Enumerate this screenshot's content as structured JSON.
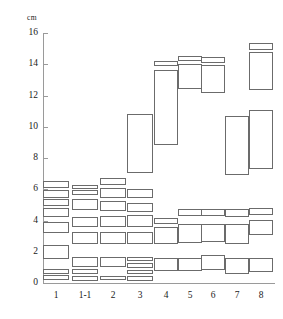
{
  "chart_data": {
    "type": "bar",
    "title": "",
    "subtitle": "",
    "xlabel": "",
    "ylabel": "cm",
    "unit_label": "cm",
    "ylim": [
      0,
      16
    ],
    "yticks": [
      0,
      2,
      4,
      6,
      8,
      10,
      12,
      14,
      16
    ],
    "ytick_labels": [
      "0",
      "2",
      "4",
      "6",
      "8",
      "10",
      "12",
      "14",
      "16"
    ],
    "grid": false,
    "legend": null,
    "categories": [
      "1",
      "1-1",
      "2",
      "3",
      "4",
      "5",
      "6",
      "7",
      "8"
    ],
    "lanes": [
      {
        "label": "1",
        "bands": [
          {
            "low": 6.05,
            "high": 6.55
          },
          {
            "low": 5.45,
            "high": 5.95
          },
          {
            "low": 4.9,
            "high": 5.35
          },
          {
            "low": 4.25,
            "high": 4.8
          },
          {
            "low": 3.2,
            "high": 3.9
          },
          {
            "low": 1.5,
            "high": 2.45
          },
          {
            "low": 0.55,
            "high": 0.9
          },
          {
            "low": 0.2,
            "high": 0.5
          }
        ]
      },
      {
        "label": "1-1",
        "bands": [
          {
            "low": 6.0,
            "high": 6.25
          },
          {
            "low": 5.65,
            "high": 5.95
          },
          {
            "low": 4.65,
            "high": 5.35
          },
          {
            "low": 3.55,
            "high": 4.25
          },
          {
            "low": 2.5,
            "high": 3.25
          },
          {
            "low": 1.05,
            "high": 1.65
          },
          {
            "low": 0.55,
            "high": 0.9
          },
          {
            "low": 0.15,
            "high": 0.45
          }
        ]
      },
      {
        "label": "2",
        "bands": [
          {
            "low": 6.25,
            "high": 6.7
          },
          {
            "low": 5.45,
            "high": 6.1
          },
          {
            "low": 4.6,
            "high": 5.25
          },
          {
            "low": 3.55,
            "high": 4.3
          },
          {
            "low": 2.5,
            "high": 3.25
          },
          {
            "low": 1.0,
            "high": 1.65
          },
          {
            "low": 0.2,
            "high": 0.45
          }
        ]
      },
      {
        "label": "3",
        "bands": [
          {
            "low": 7.05,
            "high": 10.85
          },
          {
            "low": 5.45,
            "high": 6.05
          },
          {
            "low": 4.55,
            "high": 5.15
          },
          {
            "low": 3.6,
            "high": 4.35
          },
          {
            "low": 2.5,
            "high": 3.25
          },
          {
            "low": 1.4,
            "high": 1.65
          },
          {
            "low": 0.95,
            "high": 1.3
          },
          {
            "low": 0.55,
            "high": 0.85
          },
          {
            "low": 0.15,
            "high": 0.45
          }
        ]
      },
      {
        "label": "4",
        "bands": [
          {
            "low": 13.9,
            "high": 14.2
          },
          {
            "low": 8.85,
            "high": 13.65
          },
          {
            "low": 3.75,
            "high": 4.15
          },
          {
            "low": 2.5,
            "high": 3.6
          },
          {
            "low": 0.75,
            "high": 1.6
          }
        ]
      },
      {
        "label": "5",
        "bands": [
          {
            "low": 14.2,
            "high": 14.55
          },
          {
            "low": 12.4,
            "high": 14.05
          },
          {
            "low": 4.3,
            "high": 4.75
          },
          {
            "low": 2.55,
            "high": 3.75
          },
          {
            "low": 0.75,
            "high": 1.6
          }
        ]
      },
      {
        "label": "6",
        "bands": [
          {
            "low": 14.05,
            "high": 14.45
          },
          {
            "low": 12.15,
            "high": 13.95
          },
          {
            "low": 4.3,
            "high": 4.75
          },
          {
            "low": 2.6,
            "high": 3.8
          },
          {
            "low": 0.85,
            "high": 1.8
          }
        ]
      },
      {
        "label": "7",
        "bands": [
          {
            "low": 6.9,
            "high": 10.7
          },
          {
            "low": 4.25,
            "high": 4.75
          },
          {
            "low": 2.5,
            "high": 3.8
          },
          {
            "low": 0.55,
            "high": 1.6
          }
        ]
      },
      {
        "label": "8",
        "bands": [
          {
            "low": 14.9,
            "high": 15.35
          },
          {
            "low": 12.35,
            "high": 14.8
          },
          {
            "low": 7.3,
            "high": 11.05
          },
          {
            "low": 4.35,
            "high": 4.8
          },
          {
            "low": 3.05,
            "high": 4.05
          },
          {
            "low": 0.7,
            "high": 1.6
          }
        ]
      }
    ]
  },
  "style": {
    "band_stroke": "#6b6b6b",
    "axis_color": "#9a9a9a",
    "text_color": "#1a1a1a",
    "background": "#ffffff"
  }
}
